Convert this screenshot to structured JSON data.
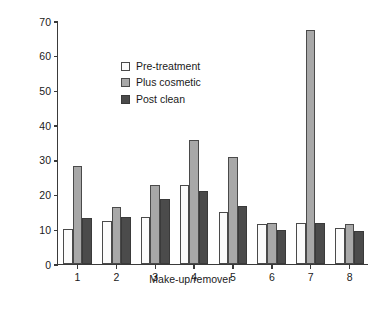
{
  "chart_data": {
    "type": "bar",
    "title": "",
    "xlabel": "Make-up/remover",
    "ylabel": "Relative absorbance",
    "categories": [
      "1",
      "2",
      "3",
      "4",
      "5",
      "6",
      "7",
      "8"
    ],
    "yticks": [
      0,
      10,
      20,
      30,
      40,
      50,
      60,
      70
    ],
    "ylim": [
      0,
      70
    ],
    "grid": false,
    "legend_position": "upper-left",
    "series": [
      {
        "name": "Pre-treatment",
        "color": "#fbfbfb",
        "values": [
          10.0,
          12.3,
          13.4,
          22.8,
          14.9,
          11.6,
          11.7,
          10.5
        ]
      },
      {
        "name": "Plus cosmetic",
        "color": "#a8a8a8",
        "values": [
          28.2,
          16.3,
          22.9,
          35.7,
          30.8,
          11.7,
          67.5,
          11.6
        ]
      },
      {
        "name": "Post clean",
        "color": "#4b4b4b",
        "values": [
          13.3,
          13.5,
          18.8,
          21.0,
          16.7,
          9.7,
          11.7,
          9.5
        ]
      }
    ]
  }
}
